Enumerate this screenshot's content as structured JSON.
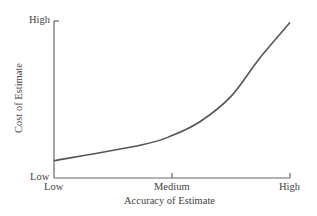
{
  "chart_data": {
    "type": "line",
    "title": "",
    "xlabel": "Accuracy of Estimate",
    "ylabel": "Cost of Estimate",
    "x_tick_labels": [
      "Low",
      "Medium",
      "High"
    ],
    "y_tick_labels": [
      "Low",
      "High"
    ],
    "xlim": [
      0,
      1
    ],
    "ylim": [
      0,
      1
    ],
    "grid": false,
    "legend": null,
    "series": [
      {
        "name": "Cost vs. Accuracy",
        "x": [
          0.0,
          0.37,
          0.5,
          0.62,
          0.75,
          0.87,
          1.0
        ],
        "y": [
          0.11,
          0.21,
          0.27,
          0.36,
          0.52,
          0.76,
          0.99
        ]
      }
    ],
    "colors": {
      "line": "#555555",
      "axis": "#666666"
    }
  },
  "axes": {
    "x": {
      "label": "Accuracy of Estimate",
      "ticks": {
        "low": "Low",
        "medium": "Medium",
        "high": "High"
      }
    },
    "y": {
      "label": "Cost of Estimate",
      "ticks": {
        "low": "Low",
        "high": "High"
      }
    }
  }
}
